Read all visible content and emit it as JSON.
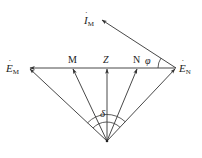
{
  "diagram": {
    "type": "phasor-diagram",
    "colors": {
      "line": "#333333",
      "background": "#ffffff"
    },
    "origin": {
      "x": 107,
      "y": 141
    },
    "baseline": {
      "y": 68,
      "x_start": 29,
      "x_end": 176
    },
    "labels": {
      "em_main": "E",
      "em_sub": "M",
      "en_main": "E",
      "en_sub": "N",
      "im_main": "I",
      "im_sub": "M",
      "point_m": "M",
      "point_z": "Z",
      "point_n": "N",
      "angle_phi": "φ",
      "angle_delta": "δ"
    },
    "vectors": [
      {
        "name": "E_M",
        "from": [
          107,
          141
        ],
        "to": [
          29,
          68
        ]
      },
      {
        "name": "M",
        "from": [
          107,
          141
        ],
        "to": [
          73,
          68
        ]
      },
      {
        "name": "Z",
        "from": [
          107,
          141
        ],
        "to": [
          107,
          68
        ]
      },
      {
        "name": "N",
        "from": [
          107,
          141
        ],
        "to": [
          137,
          68
        ]
      },
      {
        "name": "E_N",
        "from": [
          107,
          141
        ],
        "to": [
          176,
          68
        ]
      },
      {
        "name": "E_N-E_M",
        "from": [
          176,
          68
        ],
        "to": [
          29,
          68
        ]
      },
      {
        "name": "I_M",
        "from": [
          176,
          68
        ],
        "to": [
          101,
          19
        ]
      }
    ]
  }
}
